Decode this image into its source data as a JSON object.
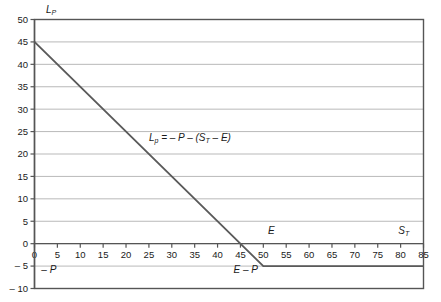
{
  "chart_data": {
    "type": "line",
    "title": "",
    "subtitle": "",
    "xlabel": "S_T",
    "ylabel": "L_P",
    "xlim": [
      0,
      85
    ],
    "ylim": [
      -10,
      50
    ],
    "grid": true,
    "legend_position": "none",
    "x_ticks": [
      0,
      5,
      10,
      15,
      20,
      25,
      30,
      35,
      40,
      45,
      50,
      55,
      60,
      65,
      70,
      75,
      80,
      85
    ],
    "y_ticks": [
      -10,
      -5,
      0,
      5,
      10,
      15,
      20,
      25,
      30,
      35,
      40,
      45,
      50
    ],
    "x_tick_labels": [
      "0",
      "5",
      "10",
      "15",
      "20",
      "25",
      "30",
      "35",
      "40",
      "45",
      "50",
      "55",
      "60",
      "65",
      "70",
      "75",
      "80",
      "85"
    ],
    "y_tick_labels": [
      "– 10",
      "– 5",
      "0",
      "5",
      "10",
      "15",
      "20",
      "25",
      "30",
      "35",
      "40",
      "45",
      "50"
    ],
    "series": [
      {
        "name": "Short put payoff",
        "x": [
          0,
          50,
          85
        ],
        "values": [
          45,
          -5,
          -5
        ],
        "color": "#5a5a5a"
      }
    ],
    "annotations": [
      {
        "id": "formula",
        "text": "L",
        "sub": "p",
        "rest": " = – P – (S",
        "sub2": "T",
        "rest2": " – E)",
        "x": 25,
        "y": 23
      },
      {
        "id": "strike-marker",
        "text": "E",
        "x": 51,
        "y": 2.2
      },
      {
        "id": "underlying-axis-label",
        "text": "S",
        "sub": "T",
        "x": 79.5,
        "y": 2.2
      },
      {
        "id": "premium-label",
        "text": "– P",
        "x": 1.5,
        "y": -6.6
      },
      {
        "id": "breakeven-label",
        "text": "E – P",
        "x": 43.5,
        "y": -6.6
      },
      {
        "id": "loss-axis-label",
        "text": "L",
        "sub": "P",
        "x": 2.5,
        "y": 51.5
      }
    ],
    "key_points": {
      "premium": 5,
      "strike": 50,
      "max_profit": 45,
      "breakeven": 45,
      "slope": -1
    }
  },
  "axis": {
    "y_axis_label": "L_P",
    "x_axis_label": "S_T"
  }
}
